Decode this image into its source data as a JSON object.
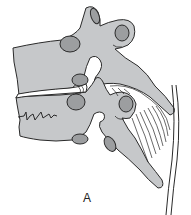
{
  "figure": {
    "label": "A",
    "colors": {
      "bone": "#c6c8ca",
      "facet_oval": "#9c9ea0",
      "outline": "#2a2a2a",
      "background": "#ffffff"
    }
  }
}
